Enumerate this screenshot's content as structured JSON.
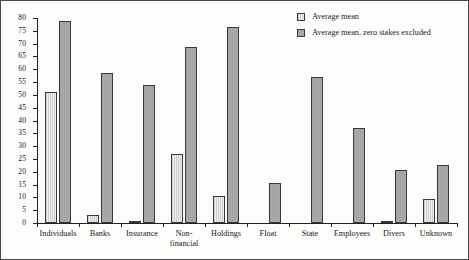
{
  "chart_data": {
    "type": "bar",
    "title": "",
    "subtitle": "",
    "xlabel": "",
    "ylabel": "",
    "ylim": [
      0,
      80
    ],
    "ytick_step": 5,
    "yticks": [
      0,
      5,
      10,
      15,
      20,
      25,
      30,
      35,
      40,
      45,
      50,
      55,
      60,
      65,
      70,
      75,
      80
    ],
    "grid": false,
    "legend_position": "top-right",
    "categories": [
      "Individuals",
      "Banks",
      "Insurance",
      "Non-\nfinancial",
      "Holdings",
      "Float",
      "State",
      "Employees",
      "Divers",
      "Unknown"
    ],
    "series": [
      {
        "name": "Average mean",
        "fill": "#e2e2e2",
        "pattern": "vertical-hatch",
        "values": [
          51,
          3,
          0.5,
          27,
          10.5,
          0,
          0,
          0,
          0.5,
          9.5
        ]
      },
      {
        "name": "Average mean, zero stakes excluded",
        "fill": "#a8a8a8",
        "pattern": "solid",
        "values": [
          79,
          58.5,
          54,
          68.5,
          76.5,
          15.5,
          57,
          37,
          20.5,
          22.5
        ]
      }
    ]
  },
  "legend": {
    "items": [
      {
        "label": "Average mean"
      },
      {
        "label": "Average mean, zero stakes excluded"
      }
    ]
  },
  "colors": {
    "series_1": "#e2e2e2",
    "series_2": "#a8a8a8",
    "axis": "#222222",
    "frame": "#4a4a4a",
    "background": "#fdfdfc"
  }
}
